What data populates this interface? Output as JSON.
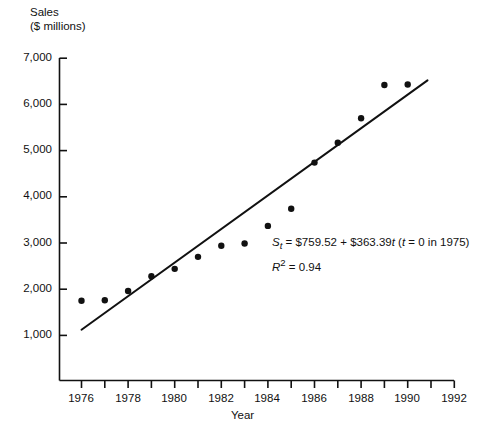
{
  "chart_data": {
    "type": "scatter",
    "title": "",
    "ylabel": "Sales ($ millions)",
    "ylabel_line1": "Sales",
    "ylabel_line2": "($ millions)",
    "xlabel": "Year",
    "xlim": [
      1976,
      1992
    ],
    "ylim": [
      1000,
      7000
    ],
    "grid": false,
    "legend": "none",
    "x": [
      1976,
      1977,
      1978,
      1979,
      1980,
      1981,
      1982,
      1983,
      1984,
      1985,
      1986,
      1987,
      1988,
      1989,
      1990
    ],
    "values": [
      1750,
      1760,
      1960,
      2280,
      2440,
      2700,
      2940,
      2990,
      3370,
      3740,
      4740,
      5170,
      5700,
      6420,
      6430
    ],
    "series": [
      {
        "name": "Sales",
        "values": [
          1750,
          1760,
          1960,
          2280,
          2440,
          2700,
          2940,
          2990,
          3370,
          3740,
          4740,
          5170,
          5700,
          6420,
          6430
        ]
      }
    ],
    "xticks": [
      1976,
      1977,
      1978,
      1979,
      1980,
      1981,
      1982,
      1983,
      1984,
      1985,
      1986,
      1987,
      1988,
      1989,
      1990,
      1991,
      1992
    ],
    "xtick_labels_major": [
      "1976",
      "1978",
      "1980",
      "1982",
      "1984",
      "1986",
      "1988",
      "1990",
      "1992"
    ],
    "xtick_major_values": [
      1976,
      1978,
      1980,
      1982,
      1984,
      1986,
      1988,
      1990,
      1992
    ],
    "yticks": [
      1000,
      2000,
      3000,
      4000,
      5000,
      6000,
      7000
    ],
    "ytick_labels": [
      "1,000",
      "2,000",
      "3,000",
      "4,000",
      "5,000",
      "6,000",
      "7,000"
    ],
    "trendline": {
      "intercept": 759.52,
      "slope": 363.39,
      "t_origin_year": 1975,
      "x_start": 1976,
      "x_end": 1990.85,
      "r_squared": 0.94
    },
    "annotation": {
      "equation_parts": {
        "s": "S",
        "s_sub": "t",
        "eq1": " = $759.52 + $363.39",
        "t_var": "t",
        "paren_open": " (",
        "t_var2": "t",
        "eq2": " = 0 in 1975)"
      },
      "r2_parts": {
        "r": "R",
        "sup": "2",
        "rest": " = 0.94"
      },
      "equation_plain": "St = $759.52 + $363.39t (t = 0 in 1975)",
      "r2_plain": "R2 = 0.94"
    },
    "style": {
      "marker_color": "#111111",
      "line_color": "#111111",
      "axis_color": "#111111",
      "background": "#ffffff",
      "marker_radius": 3.2,
      "line_width": 2
    }
  }
}
